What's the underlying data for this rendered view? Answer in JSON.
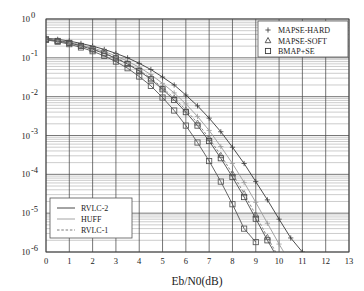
{
  "chart_data": {
    "type": "line",
    "title": "",
    "xlabel": "Eb/N0(dB)",
    "ylabel": "SER",
    "xlim": [
      0,
      13
    ],
    "ylim": [
      1e-06,
      1
    ],
    "yscale": "log",
    "xscale": "linear",
    "grid": true,
    "grid_minor": true,
    "xticks": [
      "0",
      "1",
      "2",
      "3",
      "4",
      "5",
      "6",
      "7",
      "8",
      "9",
      "10",
      "11",
      "12",
      "13"
    ],
    "yticks": [
      "10^0",
      "10^-1",
      "10^-2",
      "10^-3",
      "10^-4",
      "10^-5",
      "10^-6"
    ],
    "ytick_exponents": [
      "0",
      "-1",
      "-2",
      "-3",
      "-4",
      "-5",
      "-6"
    ],
    "marker_legend": {
      "position": "top-right",
      "entries": [
        {
          "label": "MAPSE-HARD",
          "marker": "plus"
        },
        {
          "label": "MAPSE-SOFT",
          "marker": "triangle"
        },
        {
          "label": "BMAP+SE",
          "marker": "square"
        }
      ]
    },
    "line_legend": {
      "position": "bottom-left",
      "entries": [
        {
          "label": "RVLC-2",
          "style": "solid",
          "color": "#333333"
        },
        {
          "label": "HUFF",
          "style": "solid",
          "color": "#9a9a9a"
        },
        {
          "label": "RVLC-1",
          "style": "dashed",
          "color": "#6b6b6b"
        }
      ]
    },
    "series": [
      {
        "name": "RVLC-2 / MAPSE-HARD",
        "code": "RVLC-2",
        "decoder": "MAPSE-HARD",
        "style": "solid",
        "color": "#3a3a3a",
        "marker": "plus",
        "x": [
          0,
          0.5,
          1,
          1.5,
          2,
          2.5,
          3,
          3.5,
          4,
          4.5,
          5,
          5.5,
          6,
          6.5,
          7,
          7.5,
          8,
          8.5,
          9,
          9.5,
          10,
          10.5,
          11,
          11.5
        ],
        "y": [
          0.32,
          0.3,
          0.27,
          0.235,
          0.2,
          0.165,
          0.13,
          0.1,
          0.072,
          0.05,
          0.032,
          0.02,
          0.011,
          0.0058,
          0.0028,
          0.00125,
          0.0005,
          0.00019,
          6.5e-05,
          2.2e-05,
          7e-06,
          2.3e-06,
          1e-06,
          6e-07
        ]
      },
      {
        "name": "HUFF / MAPSE-HARD",
        "code": "HUFF",
        "decoder": "MAPSE-HARD",
        "style": "solid",
        "color": "#9a9a9a",
        "marker": "plus",
        "x": [
          0,
          0.5,
          1,
          1.5,
          2,
          2.5,
          3,
          3.5,
          4,
          4.5,
          5,
          5.5,
          6,
          6.5,
          7,
          7.5,
          8,
          8.5,
          9,
          9.5,
          10,
          10.5,
          11
        ],
        "y": [
          0.31,
          0.285,
          0.255,
          0.215,
          0.18,
          0.145,
          0.112,
          0.082,
          0.057,
          0.037,
          0.022,
          0.0125,
          0.0065,
          0.0031,
          0.00135,
          0.00052,
          0.00019,
          6.2e-05,
          1.9e-05,
          5.5e-06,
          1.6e-06,
          5e-07,
          1.6e-07
        ]
      },
      {
        "name": "RVLC-1 / MAPSE-SOFT",
        "code": "RVLC-1",
        "decoder": "MAPSE-SOFT",
        "style": "dashed",
        "color": "#6b6b6b",
        "marker": "triangle",
        "x": [
          0,
          0.5,
          1,
          1.5,
          2,
          2.5,
          3,
          3.5,
          4,
          4.5,
          5,
          5.5,
          6,
          6.5,
          7,
          7.5,
          8,
          8.5,
          9,
          9.5,
          10,
          10.5
        ],
        "y": [
          0.3,
          0.275,
          0.245,
          0.205,
          0.168,
          0.133,
          0.1,
          0.072,
          0.048,
          0.03,
          0.017,
          0.0092,
          0.0046,
          0.0021,
          0.00085,
          0.00031,
          0.000105,
          3.2e-05,
          9e-06,
          2.4e-06,
          7e-07,
          4e-07
        ]
      },
      {
        "name": "RVLC-2 / BMAP+SE",
        "code": "RVLC-2",
        "decoder": "BMAP+SE",
        "style": "solid",
        "color": "#4a4a4a",
        "marker": "square",
        "x": [
          0,
          0.5,
          1,
          1.5,
          2,
          2.5,
          3,
          3.5,
          4,
          4.5,
          5,
          5.5,
          6,
          6.5,
          7,
          7.5,
          8,
          8.5,
          9,
          9.5,
          10,
          10.5
        ],
        "y": [
          0.3,
          0.272,
          0.242,
          0.202,
          0.165,
          0.13,
          0.097,
          0.069,
          0.046,
          0.028,
          0.0155,
          0.0082,
          0.004,
          0.0018,
          0.00072,
          0.00026,
          8.5e-05,
          2.6e-05,
          7.2e-06,
          2e-06,
          6e-07,
          3.5e-07
        ]
      },
      {
        "name": "HUFF / BMAP+SE (best)",
        "code": "HUFF",
        "decoder": "BMAP+SE",
        "style": "solid",
        "color": "#555555",
        "marker": "square",
        "x": [
          0,
          0.5,
          1,
          1.5,
          2,
          2.5,
          3,
          3.5,
          4,
          4.5,
          5,
          5.5,
          6,
          6.5,
          7,
          7.5,
          8,
          8.5,
          9
        ],
        "y": [
          0.29,
          0.26,
          0.225,
          0.185,
          0.148,
          0.112,
          0.08,
          0.054,
          0.033,
          0.019,
          0.0095,
          0.0044,
          0.0018,
          0.00066,
          0.00022,
          6.5e-05,
          1.7e-05,
          4e-06,
          1.8e-06
        ]
      }
    ]
  }
}
